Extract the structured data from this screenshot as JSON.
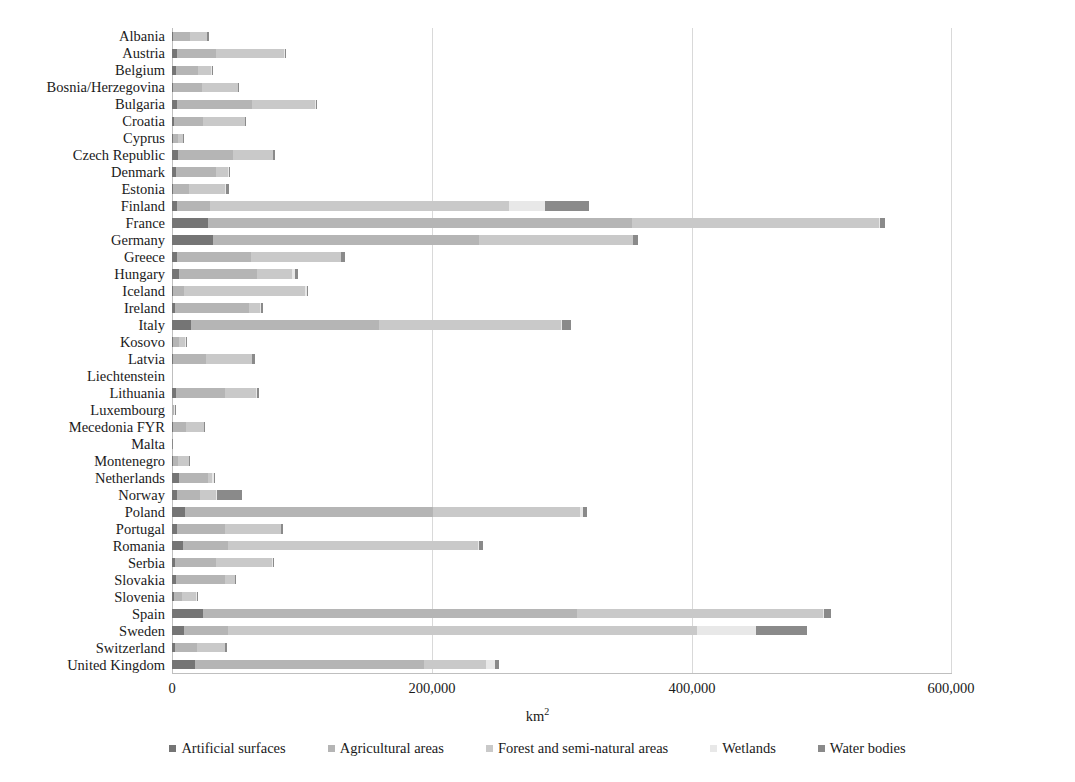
{
  "chart_data": {
    "type": "bar",
    "orientation": "horizontal",
    "stacked": true,
    "title": "",
    "xlabel": "km2",
    "xlabel_display": "km",
    "xlabel_sup": "2",
    "ylabel": "",
    "xlim": [
      0,
      600000
    ],
    "xticks": [
      0,
      200000,
      400000,
      600000
    ],
    "xtick_labels": [
      "0",
      "200,000",
      "400,000",
      "600,000"
    ],
    "grid": true,
    "legend_position": "bottom",
    "series": [
      {
        "name": "Artificial surfaces",
        "color": "#757575",
        "values": [
          330,
          4100,
          3400,
          930,
          3600,
          1800,
          300,
          4300,
          3400,
          900,
          3900,
          28000,
          31500,
          4200,
          5400,
          300,
          2600,
          14500,
          200,
          1100,
          20,
          2900,
          180,
          220,
          120,
          200,
          5300,
          3700,
          9900,
          4000,
          8400,
          2200,
          3200,
          1300,
          24000,
          9100,
          2300,
          17500
        ]
      },
      {
        "name": "Agricultural areas",
        "color": "#b5b5b5",
        "values": [
          13500,
          30000,
          17000,
          22500,
          58000,
          22500,
          5100,
          43000,
          30500,
          12500,
          25000,
          326000,
          205000,
          57000,
          60000,
          9000,
          56500,
          145000,
          5600,
          25500,
          70,
          38000,
          1400,
          10500,
          170,
          4400,
          22500,
          17500,
          191000,
          37000,
          35000,
          32000,
          38000,
          6900,
          288000,
          34000,
          17000,
          176000
        ]
      },
      {
        "name": "Forest and semi-natural areas",
        "color": "#c9c9c9",
        "values": [
          13200,
          52500,
          10000,
          27500,
          49000,
          32000,
          3600,
          30500,
          9500,
          27500,
          230000,
          190000,
          118000,
          69000,
          27000,
          93000,
          9000,
          140000,
          5100,
          35000,
          70,
          23500,
          670,
          14000,
          20,
          9000,
          3000,
          12500,
          113000,
          43000,
          192000,
          43000,
          7300,
          11000,
          189000,
          361000,
          21500,
          48000
        ]
      },
      {
        "name": "Wetlands",
        "color": "#e8e8e8",
        "values": [
          30,
          50,
          380,
          20,
          180,
          60,
          10,
          40,
          700,
          300,
          28000,
          600,
          400,
          60,
          1900,
          1200,
          300,
          300,
          10,
          200,
          5,
          700,
          5,
          20,
          5,
          20,
          1300,
          1100,
          2600,
          150,
          700,
          300,
          120,
          40,
          300,
          45000,
          30,
          7300
        ]
      },
      {
        "name": "Water bodies",
        "color": "#8a8a8a",
        "values": [
          1300,
          500,
          200,
          350,
          700,
          600,
          20,
          1100,
          800,
          2900,
          34000,
          3500,
          3400,
          2900,
          2700,
          1100,
          1400,
          7300,
          30,
          2000,
          5,
          2000,
          10,
          700,
          5,
          130,
          1300,
          19000,
          2400,
          1100,
          2900,
          1100,
          900,
          250,
          6000,
          39000,
          1400,
          2700
        ]
      }
    ],
    "categories": [
      "Albania",
      "Austria",
      "Belgium",
      "Bosnia/Herzegovina",
      "Bulgaria",
      "Croatia",
      "Cyprus",
      "Czech Republic",
      "Denmark",
      "Estonia",
      "Finland",
      "France",
      "Germany",
      "Greece",
      "Hungary",
      "Iceland",
      "Ireland",
      "Italy",
      "Kosovo",
      "Latvia",
      "Liechtenstein",
      "Lithuania",
      "Luxembourg",
      "Mecedonia FYR",
      "Malta",
      "Montenegro",
      "Netherlands",
      "Norway",
      "Poland",
      "Portugal",
      "Romania",
      "Serbia",
      "Slovakia",
      "Slovenia",
      "Spain",
      "Sweden",
      "Switzerland",
      "United Kingdom"
    ],
    "legend": [
      "Artificial surfaces",
      "Agricultural areas",
      "Forest and semi-natural areas",
      "Wetlands",
      "Water bodies"
    ]
  }
}
